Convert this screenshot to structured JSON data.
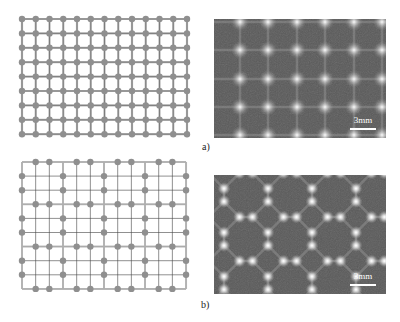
{
  "figure": {
    "panels": [
      {
        "id": "a",
        "label": "a)",
        "diagram": {
          "type": "square-lattice",
          "columns": 13,
          "rows": 9,
          "x0": 22,
          "dx": 13.75,
          "y0": 19,
          "dy": 14.4,
          "node_color": "#8f8f8f",
          "line_color": "#555555",
          "strut_color": "#b5b5b5"
        },
        "photo": {
          "pattern": "square",
          "scale_bar_label": "3mm"
        }
      },
      {
        "id": "b",
        "label": "b)",
        "diagram": {
          "type": "octagon-square-lattice",
          "columns": 13,
          "rows": 10,
          "x0": 22,
          "dx": 13.67,
          "y0": 162,
          "dy": 14.1,
          "node_color": "#8f8f8f",
          "line_color": "#444444",
          "strut_color": "#b0b0b0"
        },
        "photo": {
          "pattern": "octagon-square",
          "scale_bar_label": "3mm"
        }
      }
    ]
  },
  "colors": {
    "photo_background": "#5a5a5a",
    "photo_spot": "#ffffff",
    "label_text": "#222222"
  }
}
